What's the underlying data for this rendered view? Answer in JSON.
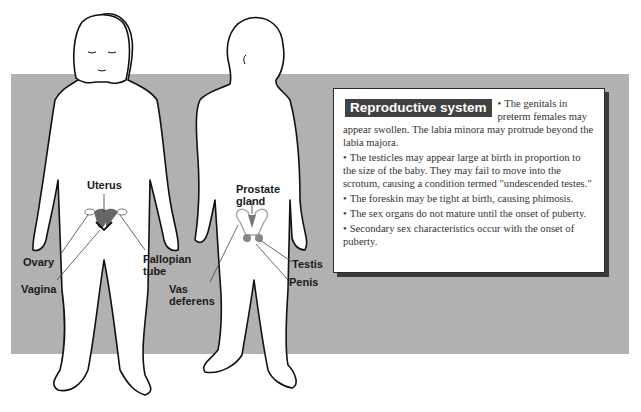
{
  "figure": {
    "band_color": "#b1b1b1",
    "female_labels": {
      "uterus": "Uterus",
      "ovary": "Ovary",
      "vagina": "Vagina",
      "fallopian_tube_1": "Fallopian",
      "fallopian_tube_2": "tube"
    },
    "male_labels": {
      "prostate_1": "Prostate",
      "prostate_2": "gland",
      "vas_1": "Vas",
      "vas_2": "deferens",
      "testis": "Testis",
      "penis": "Penis"
    }
  },
  "info_box": {
    "title": "Reproductive system",
    "bullet": "•",
    "items": [
      "The genitals in preterm females may appear swollen. The labia minora may protrude beyond the labia majora.",
      "The testicles may appear large at birth in proportion to the size of the baby. They may fail to move into the scrotum, causing a condition termed \"undescended testes.\"",
      "The foreskin may be tight at birth, causing phimosis.",
      "The sex organs do not mature until the onset of puberty.",
      "Secondary sex characteristics occur with the onset of puberty."
    ]
  }
}
